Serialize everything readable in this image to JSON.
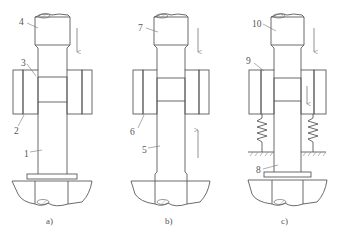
{
  "figure": {
    "panels": [
      {
        "id": "a",
        "caption": "a)",
        "labels": [
          {
            "text": "4",
            "target": "upper-punch"
          },
          {
            "text": "3",
            "target": "powder"
          },
          {
            "text": "2",
            "target": "die"
          },
          {
            "text": "1",
            "target": "lower-punch"
          }
        ],
        "arrows": [
          {
            "direction": "down",
            "target": "upper-punch"
          }
        ],
        "springs": false
      },
      {
        "id": "b",
        "caption": "b)",
        "labels": [
          {
            "text": "7",
            "target": "upper-punch"
          },
          {
            "text": "6",
            "target": "die"
          },
          {
            "text": "5",
            "target": "lower-punch"
          }
        ],
        "arrows": [
          {
            "direction": "down",
            "target": "upper-punch"
          },
          {
            "direction": "up",
            "target": "die"
          }
        ],
        "springs": false
      },
      {
        "id": "c",
        "caption": "c)",
        "labels": [
          {
            "text": "10",
            "target": "upper-punch"
          },
          {
            "text": "9",
            "target": "die"
          },
          {
            "text": "8",
            "target": "lower-punch"
          }
        ],
        "arrows": [
          {
            "direction": "down",
            "target": "upper-punch"
          },
          {
            "direction": "down",
            "target": "die"
          }
        ],
        "springs": true
      }
    ],
    "colors": {
      "line": "#5a5a5a",
      "hatch": "#8a8a8a",
      "powder": "#9a9a9a",
      "background": "#ffffff"
    }
  }
}
